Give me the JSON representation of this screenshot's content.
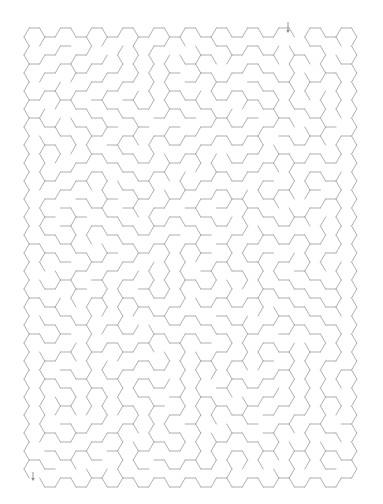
{
  "puzzle": {
    "type": "hexagonal-maze",
    "grid": {
      "columns": 21,
      "rows": 25,
      "hex_size": 10.4,
      "col_step": 15.6,
      "row_step": 18,
      "origin_x": 24,
      "origin_y": 28
    },
    "entrance": {
      "label": "start-arrow",
      "x": 288,
      "y_top": 22,
      "y_bottom": 33,
      "column": 17
    },
    "exit": {
      "label": "end-arrow",
      "x": 33,
      "y_top": 472,
      "y_bottom": 481,
      "column": 0
    },
    "seed": 73519
  },
  "colors": {
    "background": "#ffffff",
    "wall": "#a6a6a6",
    "arrow": "#8a8a8a"
  }
}
